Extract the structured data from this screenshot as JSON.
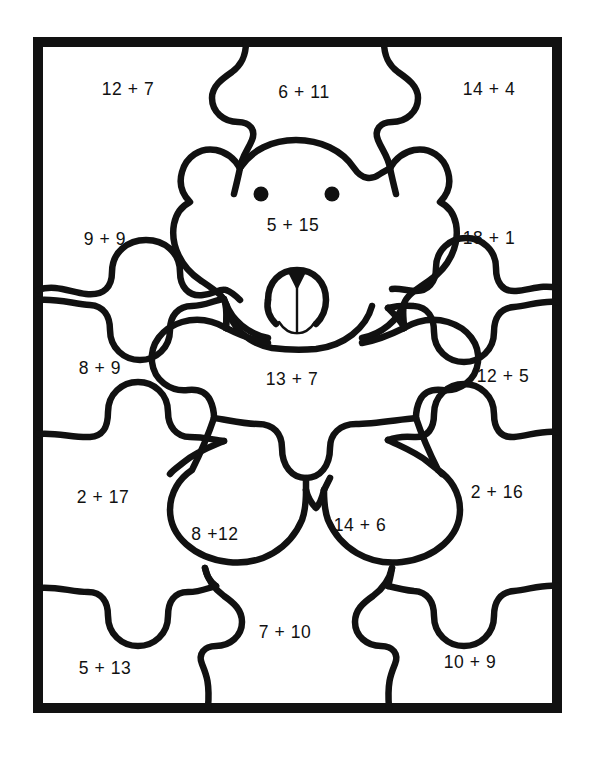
{
  "worksheet": {
    "subject": "teddy-bear-addition-puzzle",
    "border_color": "#111111",
    "ink_color": "#111111",
    "paper_color": "#ffffff"
  },
  "pieces": [
    {
      "id": "top-left",
      "equation": "12 + 7",
      "x": 128,
      "y": 89,
      "region": "corner-top-left"
    },
    {
      "id": "top-middle",
      "equation": "6 + 11",
      "x": 304,
      "y": 92,
      "region": "top-center"
    },
    {
      "id": "top-right",
      "equation": "14 + 4",
      "x": 489,
      "y": 89,
      "region": "corner-top-right"
    },
    {
      "id": "left-upper",
      "equation": "9 + 9",
      "x": 105,
      "y": 239,
      "region": "left-edge"
    },
    {
      "id": "bear-head",
      "equation": "5 + 15",
      "x": 293,
      "y": 225,
      "region": "bear-head"
    },
    {
      "id": "right-upper",
      "equation": "18 + 1",
      "x": 489,
      "y": 238,
      "region": "right-edge"
    },
    {
      "id": "left-middle",
      "equation": "8 + 9",
      "x": 100,
      "y": 368,
      "region": "left-edge"
    },
    {
      "id": "bear-body",
      "equation": "13 + 7",
      "x": 292,
      "y": 379,
      "region": "bear-torso"
    },
    {
      "id": "right-middle",
      "equation": "12 + 5",
      "x": 503,
      "y": 376,
      "region": "right-edge"
    },
    {
      "id": "left-lower",
      "equation": "2 + 17",
      "x": 103,
      "y": 497,
      "region": "left-edge"
    },
    {
      "id": "bear-leg-left",
      "equation": "8 +12",
      "x": 215,
      "y": 534,
      "region": "bear-leg-left"
    },
    {
      "id": "bear-leg-right",
      "equation": "14 + 6",
      "x": 360,
      "y": 525,
      "region": "bear-leg-right"
    },
    {
      "id": "right-lower",
      "equation": "2 + 16",
      "x": 497,
      "y": 492,
      "region": "right-edge"
    },
    {
      "id": "bottom-left",
      "equation": "5 + 13",
      "x": 105,
      "y": 668,
      "region": "corner-bottom-left"
    },
    {
      "id": "bottom-middle",
      "equation": "7 + 10",
      "x": 285,
      "y": 632,
      "region": "bottom-center"
    },
    {
      "id": "bottom-right",
      "equation": "10 + 9",
      "x": 470,
      "y": 662,
      "region": "corner-bottom-right"
    }
  ]
}
